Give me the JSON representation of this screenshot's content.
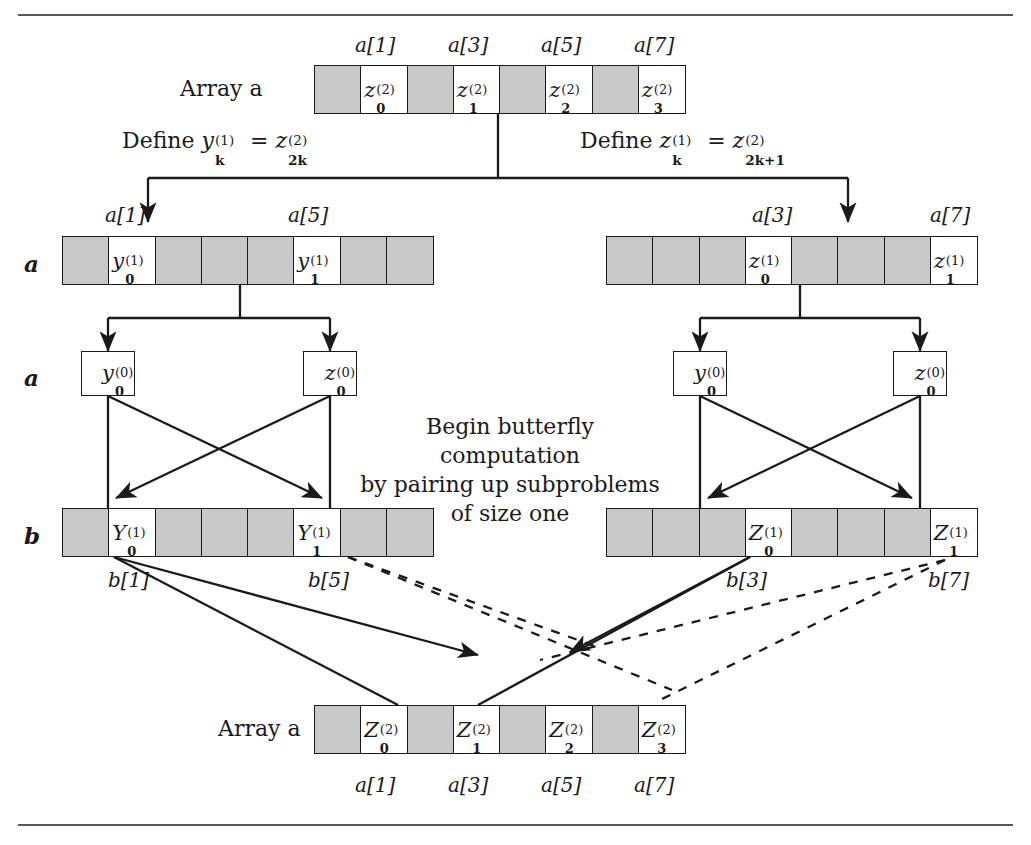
{
  "figure": {
    "kind": "fft-butterfly-recursion-diagram",
    "rules": {
      "top": true,
      "bottom": true
    }
  },
  "colors": {
    "ink": "#1a1a1a",
    "cell_gray": "#c8c8c8",
    "cell_white": "#ffffff",
    "rule": "#3a3a3a"
  },
  "top_array": {
    "title": "Array a",
    "row_label": "",
    "index_labels": [
      "a[1]",
      "a[3]",
      "a[5]",
      "a[7]"
    ],
    "cells": [
      {
        "fill": "gray",
        "label": ""
      },
      {
        "fill": "white",
        "base": "z",
        "sup": "(2)",
        "sub": "0"
      },
      {
        "fill": "gray",
        "label": ""
      },
      {
        "fill": "white",
        "base": "z",
        "sup": "(2)",
        "sub": "1"
      },
      {
        "fill": "gray",
        "label": ""
      },
      {
        "fill": "white",
        "base": "z",
        "sup": "(2)",
        "sub": "2"
      },
      {
        "fill": "gray",
        "label": ""
      },
      {
        "fill": "white",
        "base": "z",
        "sup": "(2)",
        "sub": "3"
      }
    ]
  },
  "definitions": {
    "left": {
      "prefix": "Define",
      "lhs_base": "y",
      "lhs_sup": "(1)",
      "lhs_sub": "k",
      "eq": "=",
      "rhs_base": "z",
      "rhs_sup": "(2)",
      "rhs_sub": "2k"
    },
    "right": {
      "prefix": "Define",
      "lhs_base": "z",
      "lhs_sup": "(1)",
      "lhs_sub": "k",
      "eq": "=",
      "rhs_base": "z",
      "rhs_sup": "(2)",
      "rhs_sub": "2k+1"
    }
  },
  "level1_left": {
    "row_label": "a",
    "index_labels": [
      "a[1]",
      "a[5]"
    ],
    "cells": [
      {
        "fill": "gray",
        "label": ""
      },
      {
        "fill": "white",
        "base": "y",
        "sup": "(1)",
        "sub": "0"
      },
      {
        "fill": "gray",
        "label": ""
      },
      {
        "fill": "gray",
        "label": ""
      },
      {
        "fill": "gray",
        "label": ""
      },
      {
        "fill": "white",
        "base": "y",
        "sup": "(1)",
        "sub": "1"
      },
      {
        "fill": "gray",
        "label": ""
      },
      {
        "fill": "gray",
        "label": ""
      }
    ]
  },
  "level1_right": {
    "row_label": "",
    "index_labels": [
      "a[3]",
      "a[7]"
    ],
    "cells": [
      {
        "fill": "gray",
        "label": ""
      },
      {
        "fill": "gray",
        "label": ""
      },
      {
        "fill": "gray",
        "label": ""
      },
      {
        "fill": "white",
        "base": "z",
        "sup": "(1)",
        "sub": "0"
      },
      {
        "fill": "gray",
        "label": ""
      },
      {
        "fill": "gray",
        "label": ""
      },
      {
        "fill": "gray",
        "label": ""
      },
      {
        "fill": "white",
        "base": "z",
        "sup": "(1)",
        "sub": "1"
      }
    ]
  },
  "level0": {
    "row_label": "a",
    "boxes": [
      {
        "base": "y",
        "sup": "(0)",
        "sub": "0"
      },
      {
        "base": "z",
        "sup": "(0)",
        "sub": "0"
      },
      {
        "base": "y",
        "sup": "(0)",
        "sub": "0"
      },
      {
        "base": "z",
        "sup": "(0)",
        "sub": "0"
      }
    ]
  },
  "note": {
    "text": "Begin butterfly computation\nby pairing up subproblems\nof size one"
  },
  "b_left": {
    "row_label": "b",
    "index_labels": [
      "b[1]",
      "b[5]"
    ],
    "cells": [
      {
        "fill": "gray",
        "label": ""
      },
      {
        "fill": "white",
        "base": "Y",
        "sup": "(1)",
        "sub": "0"
      },
      {
        "fill": "gray",
        "label": ""
      },
      {
        "fill": "gray",
        "label": ""
      },
      {
        "fill": "gray",
        "label": ""
      },
      {
        "fill": "white",
        "base": "Y",
        "sup": "(1)",
        "sub": "1"
      },
      {
        "fill": "gray",
        "label": ""
      },
      {
        "fill": "gray",
        "label": ""
      }
    ]
  },
  "b_right": {
    "row_label": "",
    "index_labels": [
      "b[3]",
      "b[7]"
    ],
    "cells": [
      {
        "fill": "gray",
        "label": ""
      },
      {
        "fill": "gray",
        "label": ""
      },
      {
        "fill": "gray",
        "label": ""
      },
      {
        "fill": "white",
        "base": "Z",
        "sup": "(1)",
        "sub": "0"
      },
      {
        "fill": "gray",
        "label": ""
      },
      {
        "fill": "gray",
        "label": ""
      },
      {
        "fill": "gray",
        "label": ""
      },
      {
        "fill": "white",
        "base": "Z",
        "sup": "(1)",
        "sub": "1"
      }
    ]
  },
  "bottom_array": {
    "title": "Array a",
    "index_labels": [
      "a[1]",
      "a[3]",
      "a[5]",
      "a[7]"
    ],
    "cells": [
      {
        "fill": "gray",
        "label": ""
      },
      {
        "fill": "white",
        "base": "Z",
        "sup": "(2)",
        "sub": "0"
      },
      {
        "fill": "gray",
        "label": ""
      },
      {
        "fill": "white",
        "base": "Z",
        "sup": "(2)",
        "sub": "1"
      },
      {
        "fill": "gray",
        "label": ""
      },
      {
        "fill": "white",
        "base": "Z",
        "sup": "(2)",
        "sub": "2"
      },
      {
        "fill": "gray",
        "label": ""
      },
      {
        "fill": "white",
        "base": "Z",
        "sup": "(2)",
        "sub": "3"
      }
    ]
  }
}
